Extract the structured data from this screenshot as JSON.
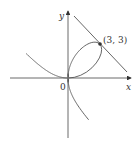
{
  "chart_data": {
    "type": "line",
    "title": "",
    "xlabel": "x",
    "ylabel": "y",
    "origin_label": "0",
    "curve": {
      "name": "folium of Descartes",
      "equation": "x^3 + y^3 = 6xy",
      "a": 2
    },
    "tangent_line": {
      "equation": "x + y = 6",
      "through": [
        3,
        3
      ],
      "slope": -1
    },
    "annotations": [
      {
        "text": "(3, 3)",
        "x": 3,
        "y": 3
      }
    ],
    "colors": {
      "curve": "#555555",
      "axes": "#444444"
    }
  },
  "labels": {
    "x": "x",
    "y": "y",
    "origin": "0",
    "point": "(3, 3)"
  }
}
